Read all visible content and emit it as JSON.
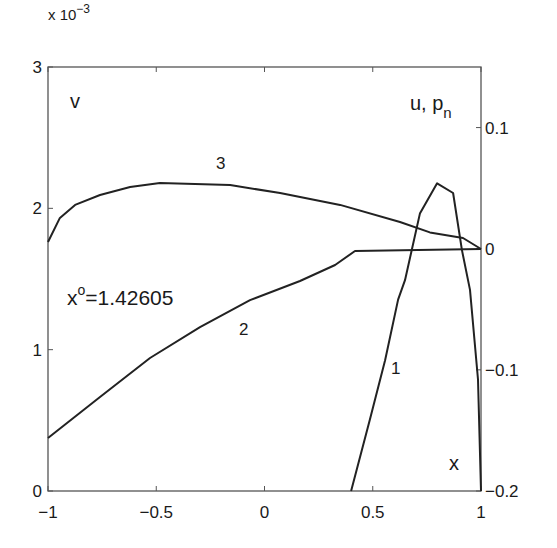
{
  "chart_data": {
    "type": "line",
    "title": "",
    "xlabel": "x",
    "ylabel_left": "v",
    "ylabel_right": "u, p_n",
    "left_axis_multiplier": "x 10^-3",
    "xlim": [
      -1,
      1
    ],
    "ylim_left": [
      0,
      3
    ],
    "ylim_right": [
      -0.2,
      0.15
    ],
    "x_ticks": [
      -1,
      -0.5,
      0,
      0.5,
      1
    ],
    "x_tick_labels": [
      "−1",
      "−0.5",
      "0",
      "0.5",
      "1"
    ],
    "y_left_ticks": [
      0,
      1,
      2,
      3
    ],
    "y_left_tick_labels": [
      "0",
      "1",
      "2",
      "3"
    ],
    "y_right_ticks": [
      -0.2,
      -0.1,
      0,
      0.1
    ],
    "y_right_tick_labels": [
      "−0.2",
      "−0.1",
      "0",
      "0.1"
    ],
    "grid": false,
    "legend": "none (inline curve labels)",
    "annotations": [
      {
        "text": "x",
        "sup": "o",
        "value": "=1.42605"
      }
    ],
    "series": [
      {
        "name": "1",
        "axis": "right",
        "quantity": "u, p_n",
        "x": [
          0.4,
          0.487,
          0.557,
          0.617,
          0.649,
          0.718,
          0.797,
          0.871,
          0.912,
          0.949,
          0.986,
          1.0
        ],
        "y": [
          -0.2,
          -0.141,
          -0.092,
          -0.042,
          -0.026,
          0.029,
          0.054,
          0.046,
          -0.001,
          -0.034,
          -0.108,
          -0.2
        ],
        "label_pos": [
          0.615,
          -0.098
        ]
      },
      {
        "name": "2",
        "axis": "left",
        "quantity": "v (x10^-3)",
        "x": [
          -1.0,
          -0.76,
          -0.529,
          -0.298,
          -0.067,
          0.164,
          0.326,
          0.418,
          1.0
        ],
        "y": [
          0.375,
          0.665,
          0.941,
          1.16,
          1.351,
          1.486,
          1.599,
          1.698,
          1.712
        ],
        "label_pos": [
          -0.09,
          1.14
        ]
      },
      {
        "name": "3",
        "axis": "left",
        "quantity": "v (x10^-3)",
        "x": [
          -1.0,
          -0.945,
          -0.875,
          -0.76,
          -0.621,
          -0.483,
          -0.159,
          0.072,
          0.349,
          0.626,
          0.764,
          0.917,
          1.0
        ],
        "y": [
          1.762,
          1.932,
          2.024,
          2.094,
          2.151,
          2.179,
          2.165,
          2.108,
          2.024,
          1.903,
          1.83,
          1.79,
          1.712
        ],
        "label_pos": [
          -0.1,
          2.28
        ]
      }
    ]
  },
  "labels": {
    "multiplier_prefix": "x 10",
    "multiplier_exp": "−3",
    "v": "v",
    "u_pn_main": "u, p",
    "u_pn_sub": "n",
    "x_axis": "x",
    "annot_base": "x",
    "annot_sup": "o",
    "annot_value": "=1.42605",
    "curve1": "1",
    "curve2": "2",
    "curve3": "3"
  }
}
